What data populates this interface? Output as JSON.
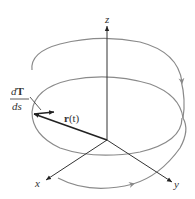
{
  "figure": {
    "type": "3d-helix-diagram",
    "axes": {
      "z": {
        "label": "z"
      },
      "x": {
        "label": "x"
      },
      "y": {
        "label": "y"
      }
    },
    "vectors": {
      "position": {
        "label_bold": "r",
        "label_rest": "(t)"
      },
      "curvature": {
        "numerator_italic": "d",
        "numerator_bold": "T",
        "denominator": "ds"
      }
    },
    "colors": {
      "axis": "#333333",
      "helix": "#8a8a8a",
      "vector": "#222222",
      "background": "#ffffff"
    }
  }
}
